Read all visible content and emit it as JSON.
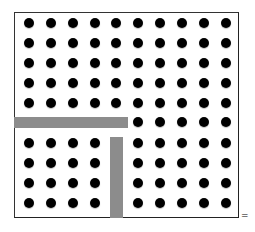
{
  "diagram": {
    "rows": 10,
    "cols": 10,
    "dot_color": "#000000",
    "bar_color": "#8c8c8c",
    "col_x": [
      29,
      51,
      73,
      95,
      116,
      138,
      160,
      182,
      204,
      226
    ],
    "row_y": [
      23,
      43,
      63,
      83,
      103,
      122,
      143,
      163,
      183,
      203
    ],
    "hidden": [
      [
        5,
        0
      ],
      [
        5,
        1
      ],
      [
        5,
        2
      ],
      [
        5,
        3
      ],
      [
        5,
        4
      ],
      [
        6,
        4
      ],
      [
        7,
        4
      ],
      [
        8,
        4
      ],
      [
        9,
        4
      ]
    ],
    "bars": [
      {
        "name": "horizontal-divider-bar",
        "x": 14,
        "y": 117,
        "w": 114,
        "h": 11
      },
      {
        "name": "vertical-divider-bar",
        "x": 110,
        "y": 137,
        "w": 13,
        "h": 81
      }
    ],
    "equals_sign": "="
  }
}
